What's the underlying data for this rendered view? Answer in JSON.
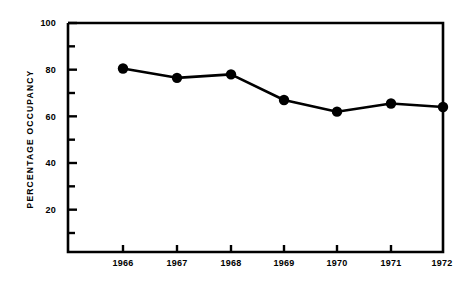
{
  "chart_data": {
    "type": "line",
    "title": "",
    "xlabel": "",
    "ylabel": "PERCENTAGE  OCCUPANCY",
    "categories": [
      "1966",
      "1967",
      "1968",
      "1969",
      "1970",
      "1971",
      "1972"
    ],
    "values": [
      80.5,
      76.5,
      78,
      67,
      62,
      65.5,
      64
    ],
    "series": [
      {
        "name": "Percentage occupancy",
        "values": [
          80.5,
          76.5,
          78,
          67,
          62,
          65.5,
          64
        ]
      }
    ],
    "ylim": [
      0,
      100
    ],
    "y_major_ticks": [
      20,
      40,
      60,
      80,
      100
    ],
    "y_minor_ticks": [
      10,
      30,
      50,
      70,
      90
    ],
    "y_tick_labels": [
      "20",
      "40",
      "60",
      "80",
      "100"
    ],
    "x_tick_labels": [
      "1966",
      "1967",
      "1968",
      "1969",
      "1970",
      "1971",
      "1972"
    ],
    "grid": false,
    "legend": false,
    "marker": "filled-circle",
    "line_color": "#000000",
    "marker_color": "#000000",
    "background_color": "#ffffff"
  },
  "axes": {
    "y_labels": [
      "100",
      "80",
      "60",
      "40",
      "20"
    ],
    "x_labels": [
      "1966",
      "1967",
      "1968",
      "1969",
      "1970",
      "1971",
      "1972"
    ],
    "y_axis_title": "PERCENTAGE  OCCUPANCY"
  },
  "title_fragment": ""
}
